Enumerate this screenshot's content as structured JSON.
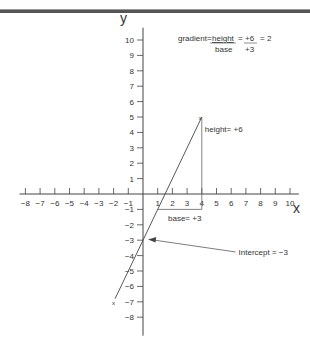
{
  "header_bar": {
    "color": "#555555"
  },
  "axes": {
    "x_label": "x",
    "y_label": "y",
    "x_ticks": [
      -8,
      -7,
      -6,
      -5,
      -4,
      -3,
      -2,
      -1,
      1,
      2,
      3,
      4,
      5,
      6,
      7,
      8,
      9,
      10
    ],
    "y_ticks": [
      10,
      9,
      8,
      7,
      6,
      5,
      4,
      3,
      2,
      1,
      -1,
      -2,
      -3,
      -4,
      -5,
      -6,
      -7,
      -8
    ]
  },
  "formula": {
    "prefix": "gradient=",
    "num1": "height",
    "den1": "base",
    "eq1": "=",
    "num2": "+6",
    "den2": "+3",
    "result": "= 2"
  },
  "annotations": {
    "height": "height= +6",
    "base": "base= +3",
    "intercept": "Intercept = −3",
    "point_mark": "x"
  },
  "line": {
    "slope": 2,
    "intercept": -3,
    "from": [
      -1,
      -5
    ],
    "to": [
      4,
      5
    ]
  },
  "triangle": {
    "p1": [
      1,
      -1
    ],
    "p2": [
      4,
      -1
    ],
    "p3": [
      4,
      5
    ]
  }
}
